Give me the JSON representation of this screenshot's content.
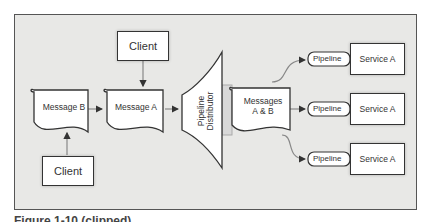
{
  "diagram": {
    "clients": [
      {
        "id": "client-top",
        "label": "Client"
      },
      {
        "id": "client-bottom",
        "label": "Client"
      }
    ],
    "messages": [
      {
        "id": "message-b",
        "label": "Message B"
      },
      {
        "id": "message-a",
        "label": "Message A"
      },
      {
        "id": "messages-ab",
        "label_line1": "Messages",
        "label_line2": "A & B"
      }
    ],
    "distributor": {
      "label_line1": "Pipeline",
      "label_line2": "Distributor"
    },
    "pipelines": [
      {
        "label": "Pipeline",
        "service": "Service A"
      },
      {
        "label": "Pipeline",
        "service": "Service A"
      },
      {
        "label": "Pipeline",
        "service": "Service A"
      }
    ],
    "caption": "Figure 1-10 (clipped)"
  }
}
